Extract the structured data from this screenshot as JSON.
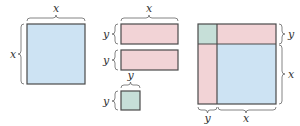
{
  "diagram": {
    "colors": {
      "x_squared": "#cde3f3",
      "xy_rect": "#f2d3d6",
      "y_squared": "#c6dfd8",
      "stroke": "#4a4a4a"
    },
    "tiles": {
      "x_square": {
        "top_label": "x",
        "side_label": "x"
      },
      "xy_rect_1": {
        "top_label": "x",
        "side_label": "y"
      },
      "xy_rect_2": {
        "side_label": "y"
      },
      "y_square": {
        "top_label": "y",
        "side_label": "y"
      }
    },
    "composite": {
      "right_top_label": "y",
      "right_bottom_label": "x",
      "bottom_left_label": "y",
      "bottom_right_label": "x"
    }
  }
}
